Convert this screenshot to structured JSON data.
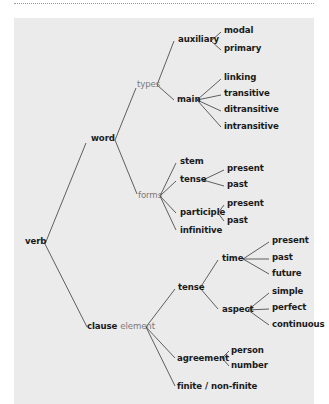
{
  "diagram": {
    "title": "",
    "type": "tree",
    "root": "verb",
    "nodes": {
      "verb": "verb",
      "word": "word",
      "types": "types",
      "auxiliary": "auxiliary",
      "modal": "modal",
      "primary": "primary",
      "main": "main",
      "linking": "linking",
      "transitive": "transitive",
      "ditransitive": "ditransitive",
      "intransitive": "intransitive",
      "forms": "forms",
      "stem": "stem",
      "forms_tense": "tense",
      "forms_tense_present": "present",
      "forms_tense_past": "past",
      "participle": "participle",
      "participle_present": "present",
      "participle_past": "past",
      "infinitive": "infinitive",
      "clause": "clause",
      "clause_suffix": "element",
      "clause_tense": "tense",
      "time": "time",
      "time_present": "present",
      "time_past": "past",
      "time_future": "future",
      "aspect": "aspect",
      "simple": "simple",
      "perfect": "perfect",
      "continuous": "continuous",
      "agreement": "agreement",
      "person": "person",
      "number": "number",
      "finite": "finite / non-finite"
    },
    "tree": {
      "verb": {
        "word": {
          "types": {
            "auxiliary": [
              "modal",
              "primary"
            ],
            "main": [
              "linking",
              "transitive",
              "ditransitive",
              "intransitive"
            ]
          },
          "forms": {
            "stem": [],
            "tense": [
              "present",
              "past"
            ],
            "participle": [
              "present",
              "past"
            ],
            "infinitive": []
          }
        },
        "clause element": {
          "tense": {
            "time": [
              "present",
              "past",
              "future"
            ],
            "aspect": [
              "simple",
              "perfect",
              "continuous"
            ]
          },
          "agreement": [
            "person",
            "number"
          ],
          "finite / non-finite": []
        }
      }
    },
    "colors": {
      "background": "#ebebeb",
      "line": "#3a3a3a",
      "primary_text": "#1a1a1a",
      "secondary_text": "#7a7a7a"
    }
  }
}
